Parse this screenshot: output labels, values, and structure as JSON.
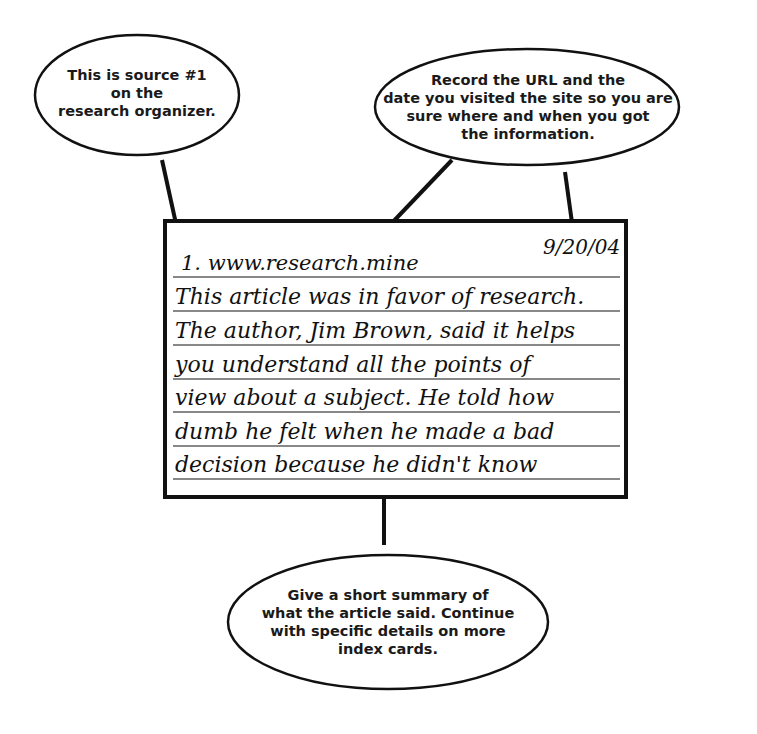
{
  "callouts": {
    "source": {
      "lines": [
        "This is source #1",
        "on the",
        "research organizer."
      ]
    },
    "url_date": {
      "lines": [
        "Record the URL and the",
        "date you visited the site so you are",
        "sure where and when you got",
        "the information."
      ]
    },
    "summary": {
      "lines": [
        "Give a short summary of",
        "what the article said. Continue",
        "with specific details on more",
        "index cards."
      ]
    }
  },
  "index_card": {
    "source_line": "1. www.research.mine",
    "date": "9/20/04",
    "summary_lines": [
      "This article was in favor of research.",
      "The author, Jim Brown, said it helps",
      "you understand all the points of",
      "view about a subject. He told how",
      "dumb he felt when he made a bad",
      "decision because he didn't know"
    ]
  },
  "colors": {
    "ink": "#111111",
    "rule": "#888888",
    "background": "#ffffff"
  }
}
